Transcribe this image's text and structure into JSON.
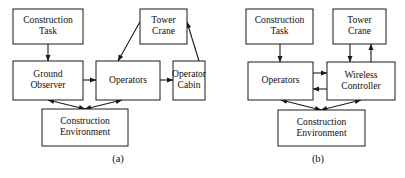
{
  "figure": {
    "background_color": "#ffffff",
    "stroke_color": "#1a1a1a",
    "box_fill_color": "#ffffff"
  },
  "panels": [
    {
      "id": "a",
      "caption": "(a)",
      "caption_x": 118,
      "caption_y": 160,
      "nodes": [
        {
          "id": "a-construction-task",
          "line1": "Construction",
          "line2": "Task",
          "x": 13,
          "y": 9,
          "w": 70,
          "h": 35
        },
        {
          "id": "a-tower-crane",
          "line1": "Tower",
          "line2": "Crane",
          "x": 140,
          "y": 9,
          "w": 47,
          "h": 35
        },
        {
          "id": "a-ground-observer",
          "line1": "Ground",
          "line2": "Observer",
          "x": 13,
          "y": 61,
          "w": 70,
          "h": 39
        },
        {
          "id": "a-operators",
          "line1": "Operators",
          "line2": "",
          "x": 96,
          "y": 61,
          "w": 64,
          "h": 39
        },
        {
          "id": "a-operator-cabin",
          "line1": "Operator",
          "line2": "Cabin",
          "x": 173,
          "y": 61,
          "w": 32,
          "h": 39
        },
        {
          "id": "a-construction-environment",
          "line1": "Construction",
          "line2": "Environment",
          "x": 42,
          "y": 109,
          "w": 86,
          "h": 37
        }
      ],
      "edges": [
        {
          "id": "a-task-to-observer",
          "from": "a-construction-task",
          "to": "a-ground-observer",
          "type": "single",
          "points": "48,44 48,61"
        },
        {
          "id": "a-observer-to-operators",
          "from": "a-ground-observer",
          "to": "a-operators",
          "type": "single",
          "points": "83,80 96,80"
        },
        {
          "id": "a-crane-to-operators",
          "from": "a-tower-crane",
          "to": "a-operators",
          "type": "single",
          "points": "141,20 118,61"
        },
        {
          "id": "a-operators-to-cabin",
          "from": "a-operators",
          "to": "a-operator-cabin",
          "type": "single",
          "points": "160,80 173,80"
        },
        {
          "id": "a-cabin-to-crane",
          "from": "a-operator-cabin",
          "to": "a-tower-crane",
          "type": "single",
          "points": "199,61 187,22"
        },
        {
          "id": "a-environment-observer",
          "from": "a-construction-environment",
          "to": "a-ground-observer",
          "type": "double",
          "points": "85,109 48,100"
        },
        {
          "id": "a-environment-operators",
          "from": "a-construction-environment",
          "to": "a-operators",
          "type": "double",
          "points": "85,109 122,100"
        }
      ]
    },
    {
      "id": "b",
      "caption": "(b)",
      "caption_x": 318,
      "caption_y": 160,
      "nodes": [
        {
          "id": "b-construction-task",
          "line1": "Construction",
          "line2": "Task",
          "x": 246,
          "y": 9,
          "w": 67,
          "h": 35
        },
        {
          "id": "b-tower-crane",
          "line1": "Tower",
          "line2": "Crane",
          "x": 333,
          "y": 9,
          "w": 53,
          "h": 35
        },
        {
          "id": "b-operators",
          "line1": "Operators",
          "line2": "",
          "x": 248,
          "y": 62,
          "w": 65,
          "h": 38
        },
        {
          "id": "b-wireless-controller",
          "line1": "Wireless",
          "line2": "Controller",
          "x": 327,
          "y": 62,
          "w": 68,
          "h": 38
        },
        {
          "id": "b-construction-environment",
          "line1": "Construction",
          "line2": "Environment",
          "x": 278,
          "y": 110,
          "w": 87,
          "h": 36
        }
      ],
      "edges": [
        {
          "id": "b-task-to-operators",
          "from": "b-construction-task",
          "to": "b-operators",
          "type": "single",
          "points": "280,44 280,62"
        },
        {
          "id": "b-crane-to-controller",
          "from": "b-tower-crane",
          "to": "b-wireless-controller",
          "type": "single",
          "points": "350,44 350,62"
        },
        {
          "id": "b-controller-to-crane",
          "from": "b-wireless-controller",
          "to": "b-tower-crane",
          "type": "single",
          "points": "371,62 371,44"
        },
        {
          "id": "b-operators-to-controller",
          "from": "b-operators",
          "to": "b-wireless-controller",
          "type": "single",
          "points": "313,73 327,73"
        },
        {
          "id": "b-controller-to-operators",
          "from": "b-wireless-controller",
          "to": "b-operators",
          "type": "single",
          "points": "327,89 313,89"
        },
        {
          "id": "b-environment-operators",
          "from": "b-construction-environment",
          "to": "b-operators",
          "type": "double",
          "points": "321,110 281,100"
        },
        {
          "id": "b-environment-controller",
          "from": "b-construction-environment",
          "to": "b-wireless-controller",
          "type": "double",
          "points": "321,110 361,100"
        }
      ]
    }
  ]
}
